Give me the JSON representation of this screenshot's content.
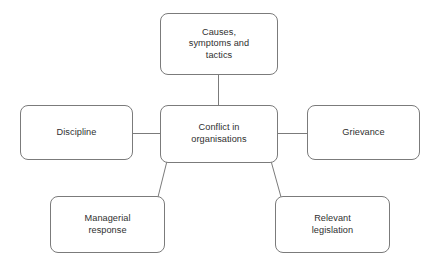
{
  "diagram": {
    "type": "concept-map",
    "center": {
      "id": "center",
      "label": "Conflict in\norganisations"
    },
    "nodes": [
      {
        "id": "top",
        "label": "Causes,\nsymptoms and\ntactics"
      },
      {
        "id": "left",
        "label": "Discipline"
      },
      {
        "id": "right",
        "label": "Grievance"
      },
      {
        "id": "bottomleft",
        "label": "Managerial\nresponse"
      },
      {
        "id": "bottomright",
        "label": "Relevant\nlegislation"
      }
    ],
    "connectors": [
      {
        "from": "center",
        "to": "top",
        "style": "straight-vertical",
        "x1": 218,
        "y1": 105,
        "x2": 218,
        "y2": 75
      },
      {
        "from": "center",
        "to": "left",
        "style": "straight-horizontal",
        "x1": 160,
        "y1": 133,
        "x2": 133,
        "y2": 133
      },
      {
        "from": "center",
        "to": "right",
        "style": "straight-horizontal",
        "x1": 278,
        "y1": 133,
        "x2": 307,
        "y2": 133
      },
      {
        "from": "center",
        "to": "bottomleft",
        "style": "diagonal",
        "x1": 167,
        "y1": 161,
        "x2": 158,
        "y2": 197
      },
      {
        "from": "center",
        "to": "bottomright",
        "style": "diagonal",
        "x1": 271,
        "y1": 161,
        "x2": 281,
        "y2": 197
      }
    ],
    "style": {
      "line_color": "#7b7b7b",
      "box_border_color": "#7b7b7b",
      "box_fill_color": "#ffffff",
      "text_color": "#2f2f2f",
      "background_color": "#ffffff"
    }
  }
}
